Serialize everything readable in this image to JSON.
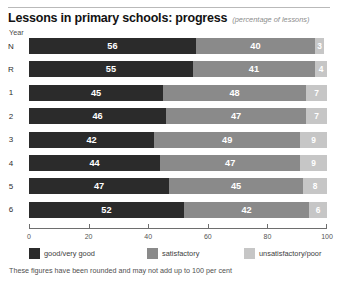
{
  "header": {
    "title": "Lessons in primary schools: progress",
    "subtitle": "(percentage of lessons)",
    "axis_name": "Year"
  },
  "footnote": "These figures have been rounded and may not add up to 100 per cent",
  "colors": {
    "good": "#2b2b2b",
    "satisfactory": "#8a8a8a",
    "unsatisfactory": "#c6c6c6",
    "background": "#ffffff",
    "rule": "#b9b9b9"
  },
  "chart_data": {
    "type": "bar",
    "orientation": "horizontal",
    "stacked": true,
    "title": "Lessons in primary schools: progress",
    "subtitle": "(percentage of lessons)",
    "xlabel": "",
    "ylabel": "Year",
    "xlim": [
      0,
      100
    ],
    "xticks": [
      0,
      20,
      40,
      60,
      80,
      100
    ],
    "xticklabels": [
      "0",
      "20",
      "40",
      "60",
      "80",
      "100"
    ],
    "grid": false,
    "legend_position": "bottom",
    "categories": [
      "N",
      "R",
      "1",
      "2",
      "3",
      "4",
      "5",
      "6"
    ],
    "series": [
      {
        "name": "good/very good",
        "color": "#2b2b2b",
        "values": [
          56,
          55,
          45,
          46,
          42,
          44,
          47,
          52
        ]
      },
      {
        "name": "satisfactory",
        "color": "#8a8a8a",
        "values": [
          40,
          41,
          48,
          47,
          49,
          47,
          45,
          42
        ]
      },
      {
        "name": "unsatisfactory/poor",
        "color": "#c6c6c6",
        "values": [
          3,
          4,
          7,
          7,
          9,
          9,
          8,
          6
        ]
      }
    ],
    "annotations": [
      "These figures have been rounded and may not add up to 100 per cent"
    ]
  }
}
